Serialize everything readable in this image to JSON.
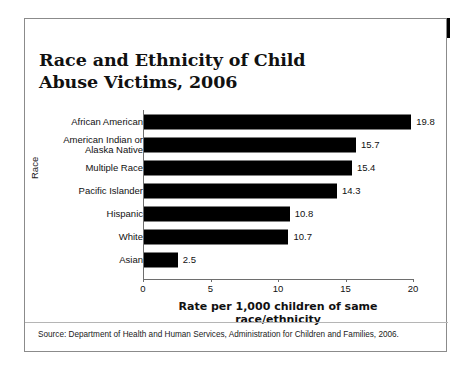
{
  "banner": {
    "label": "DID YOU KNOW?"
  },
  "chart_data": {
    "type": "bar",
    "orientation": "horizontal",
    "title": "Race and Ethnicity of Child Abuse Victims, 2006",
    "xlabel": "Rate per 1,000 children of same race/ethnicity",
    "ylabel": "Race",
    "categories": [
      "African American",
      "American Indian or\nAlaska Native",
      "Multiple Race",
      "Pacific Islander",
      "Hispanic",
      "White",
      "Asian"
    ],
    "values": [
      19.8,
      15.7,
      15.4,
      14.3,
      10.8,
      10.7,
      2.5
    ],
    "value_labels": [
      "19.8",
      "15.7",
      "15.4",
      "14.3",
      "10.8",
      "10.7",
      "2.5"
    ],
    "xlim": [
      0,
      20
    ],
    "xticks": [
      0,
      5,
      10,
      15,
      20
    ],
    "xtick_labels": [
      "0",
      "5",
      "10",
      "15",
      "20"
    ],
    "grid": false,
    "legend": false,
    "bar_color": "#000000"
  },
  "source": {
    "note": "Source: Department of Health and Human Services, Administration for Children and Families, 2006."
  }
}
